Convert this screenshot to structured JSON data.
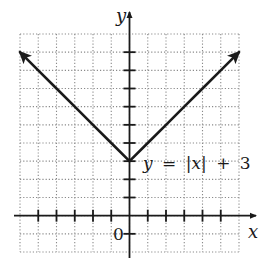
{
  "chart_data": {
    "type": "line",
    "title": "",
    "equation_label": "y = |x| + 3",
    "equation_parts": {
      "y": "y",
      "eq": "=",
      "abs_x": "|x|",
      "plus": "+",
      "c": "3"
    },
    "xlabel": "x",
    "ylabel": "y",
    "origin_label": "0",
    "xlim": [
      -6,
      6
    ],
    "ylim": [
      -2,
      10
    ],
    "grid": true,
    "grid_style": "dotted",
    "x_ticks": [
      -5,
      -4,
      -3,
      -2,
      -1,
      1,
      2,
      3,
      4,
      5
    ],
    "y_ticks": [
      -1,
      1,
      2,
      3,
      4,
      5,
      6,
      7,
      8,
      9
    ],
    "series": [
      {
        "name": "y = |x| + 3",
        "x": [
          -6,
          -5,
          -4,
          -3,
          -2,
          -1,
          0,
          1,
          2,
          3,
          4,
          5,
          6
        ],
        "y": [
          9,
          8,
          7,
          6,
          5,
          4,
          3,
          4,
          5,
          6,
          7,
          8,
          9
        ],
        "arrows_at_ends": true
      }
    ],
    "vertex": [
      0,
      3
    ]
  },
  "colors": {
    "ink": "#1a1a1a",
    "grid": "#8a8a8a",
    "background": "#ffffff"
  }
}
